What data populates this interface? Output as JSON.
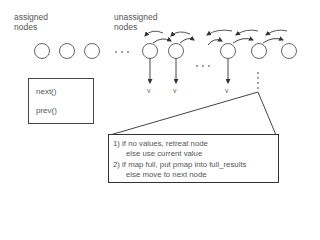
{
  "labels": {
    "assigned": [
      "assigned",
      "nodes"
    ],
    "unassigned": [
      "unassigned",
      "nodes"
    ]
  },
  "nodes": {
    "assigned_count": 3,
    "unassigned_count": 5,
    "ellipsis": "· · ·"
  },
  "value_label": "v",
  "legend": {
    "items": [
      {
        "label": "next()",
        "arrow": "curved-arrow-right"
      },
      {
        "label": "prev()",
        "arrow": "curved-arrow-left"
      }
    ]
  },
  "callout": {
    "lines": [
      "1)  if no values, retreat node",
      "else use current value",
      "2)  if map full, put pmap into full_results",
      "else move to next node"
    ]
  },
  "colors": {
    "stroke": "#555555",
    "text": "#555555",
    "box_border": "#333333"
  }
}
